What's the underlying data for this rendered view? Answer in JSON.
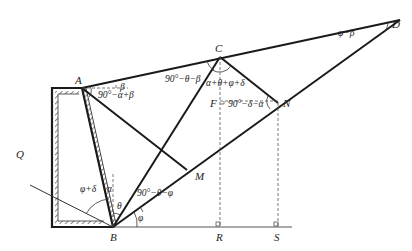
{
  "diagram": {
    "title": "",
    "points": {
      "A": {
        "label": "A",
        "x": 82,
        "y": 88
      },
      "B": {
        "label": "B",
        "x": 113,
        "y": 227
      },
      "C": {
        "label": "C",
        "x": 220,
        "y": 57
      },
      "D": {
        "label": "D",
        "x": 400,
        "y": 20
      },
      "N": {
        "label": "N",
        "x": 278,
        "y": 103
      },
      "M": {
        "label": "M",
        "x": 187,
        "y": 170
      },
      "F": {
        "label": "F",
        "x": 220,
        "y": 101
      },
      "R": {
        "label": "R",
        "x": 220,
        "y": 226
      },
      "S": {
        "label": "S",
        "x": 278,
        "y": 226
      },
      "Q": {
        "label": "Q",
        "x": 30,
        "y": 185
      }
    },
    "angle_labels": {
      "at_A_beta": "β",
      "at_A_main": "90°−α+β",
      "at_C_left": "90°−θ−β",
      "at_C_main": "α+θ+φ+δ",
      "at_N": "90°−δ−α",
      "at_D": "φ−β",
      "at_B_phi_delta": "φ+δ",
      "at_B_alpha": "α",
      "at_B_theta": "θ",
      "at_B_mid": "90°−θ−φ",
      "at_B_phi": "φ"
    },
    "colors": {
      "line": "#1a1a1a",
      "dashed": "#555555",
      "background": "#ffffff"
    }
  }
}
